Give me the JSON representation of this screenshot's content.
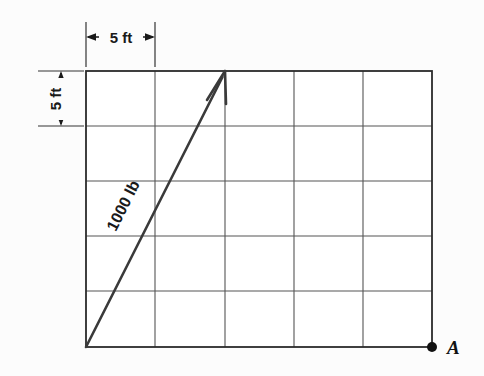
{
  "figure": {
    "type": "engineering-statics-diagram",
    "background_color": "#fcfcfc",
    "line_color": "#333333",
    "grid_line_color": "#555555",
    "border_color": "#2b2b2b",
    "text_color": "#1a1a1a",
    "grid": {
      "columns": 5,
      "rows": 5,
      "cell_size_label": "5 ft",
      "left_px": 86,
      "top_px": 71,
      "right_px": 432,
      "bottom_px": 347,
      "x_lines": [
        86,
        155,
        225,
        294,
        363,
        432
      ],
      "y_lines": [
        71,
        126,
        181,
        236,
        291,
        347
      ]
    },
    "dimensions": [
      {
        "name": "horizontal-dimension",
        "label": "5 ft",
        "orientation": "horizontal",
        "from_px": 86,
        "to_px": 155,
        "line_y_px": 39,
        "text_x_px": 120,
        "text_y_px": 36
      },
      {
        "name": "vertical-dimension",
        "label": "5 ft",
        "orientation": "vertical",
        "from_px": 71,
        "to_px": 126,
        "line_x_px": 62,
        "text_x_px": 54,
        "text_y_px": 99,
        "rotation_deg": -90
      }
    ],
    "force_vector": {
      "label": "1000 lb",
      "magnitude": 1000,
      "units": "lb",
      "tail_px": [
        86,
        347
      ],
      "head_px": [
        225,
        71
      ],
      "label_x_px": 128,
      "label_y_px": 208,
      "label_rotation_deg": -63,
      "arrowhead": "open-v"
    },
    "point_marker": {
      "label": "A",
      "dot_x_px": 432,
      "dot_y_px": 347,
      "dot_radius_px": 5,
      "label_x_px": 448,
      "label_y_px": 353
    }
  }
}
